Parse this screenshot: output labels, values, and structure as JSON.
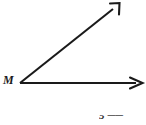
{
  "figure": {
    "type": "geometry-angle-diagram",
    "background_color": "#ffffff",
    "stroke_color": "#1a1a1a",
    "vertex_label": "M",
    "rays": [
      {
        "name": "horizontal-ray",
        "label": "",
        "direction": "right",
        "from": [
          20,
          83
        ],
        "to": [
          142,
          83
        ],
        "arrowhead": "right-arrowhead"
      },
      {
        "name": "diagonal-ray",
        "label": "",
        "direction": "up-right",
        "from": [
          20,
          83
        ],
        "to": [
          119,
          4
        ],
        "arrowhead": "up-right-arrowhead"
      }
    ],
    "vertex_point": [
      20,
      83
    ],
    "cropped_caption": {
      "text": "5",
      "ray_symbol": "▀▀",
      "note": "partially cropped at bottom edge"
    }
  }
}
